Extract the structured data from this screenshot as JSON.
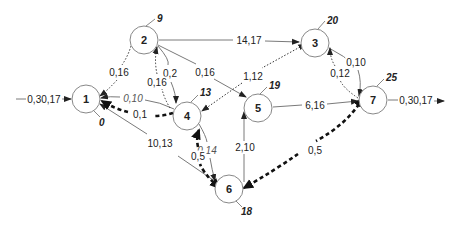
{
  "diagram": {
    "type": "network-graph",
    "colors": {
      "solid_edge": "#7a7a7a",
      "dotted_edge": "#333333",
      "thick_dashed_edge": "#111111",
      "node_stroke": "#888888",
      "text": "#222222"
    },
    "nodes": [
      {
        "id": "1",
        "label": "1",
        "time": "0",
        "x": 86,
        "y": 99,
        "tx": 97,
        "ty": 122
      },
      {
        "id": "2",
        "label": "2",
        "time": "9",
        "x": 144,
        "y": 40,
        "tx": 158,
        "ty": 20
      },
      {
        "id": "3",
        "label": "3",
        "time": "20",
        "x": 315,
        "y": 43,
        "tx": 327,
        "ty": 22
      },
      {
        "id": "4",
        "label": "4",
        "time": "13",
        "x": 187,
        "y": 116,
        "tx": 198,
        "ty": 93
      },
      {
        "id": "5",
        "label": "5",
        "time": "19",
        "x": 258,
        "y": 108,
        "tx": 268,
        "ty": 86
      },
      {
        "id": "6",
        "label": "6",
        "time": "18",
        "x": 229,
        "y": 189,
        "tx": 240,
        "ty": 212
      },
      {
        "id": "7",
        "label": "7",
        "time": "25",
        "x": 373,
        "y": 100,
        "tx": 385,
        "ty": 78
      }
    ],
    "entry": {
      "label": "0,30,17",
      "to": "1"
    },
    "exit": {
      "label": "0,30,17",
      "from": "7"
    },
    "edges": [
      {
        "from": "2",
        "to": "3",
        "label": "14,17",
        "style": "solid"
      },
      {
        "from": "2",
        "to": "5",
        "label": "0,16",
        "style": "solid"
      },
      {
        "from": "2",
        "to": "4",
        "label": "0,2",
        "style": "solid"
      },
      {
        "from": "4",
        "to": "1",
        "label": "0,10",
        "style": "solid",
        "italic": true
      },
      {
        "from": "6",
        "to": "1",
        "label": "10,13",
        "style": "solid"
      },
      {
        "from": "6",
        "to": "5",
        "label": "2,10",
        "style": "solid"
      },
      {
        "from": "5",
        "to": "7",
        "label": "6,16",
        "style": "solid"
      },
      {
        "from": "3",
        "to": "7",
        "label": "0,10",
        "style": "solid"
      },
      {
        "from": "4",
        "to": "6",
        "label": "0,14",
        "style": "solid",
        "italic": true
      },
      {
        "from": "2",
        "to": "1",
        "label": "0,16",
        "style": "dotted"
      },
      {
        "from": "4",
        "to": "2",
        "label": "0,16",
        "style": "dotted"
      },
      {
        "from": "3",
        "to": "4",
        "label": "1,12",
        "style": "dotted",
        "bidirectional": true
      },
      {
        "from": "7",
        "to": "3",
        "label": "0,12",
        "style": "dotted"
      },
      {
        "from": "4",
        "to": "1",
        "label": "0,1",
        "style": "thick-dashed"
      },
      {
        "from": "6",
        "to": "4",
        "label": "0,5",
        "style": "thick-dashed",
        "bidirectional": true
      },
      {
        "from": "7",
        "to": "6",
        "label": "0,5",
        "style": "thick-dashed",
        "bidirectional": true
      }
    ]
  }
}
